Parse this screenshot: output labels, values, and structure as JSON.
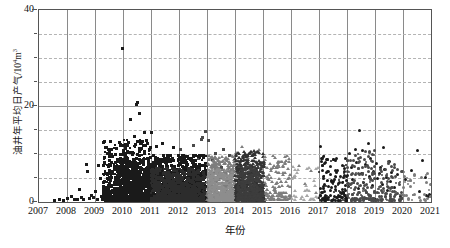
{
  "chart_data": {
    "type": "scatter",
    "title": "",
    "xlabel": "年份",
    "ylabel": "油井年平均日产气/10",
    "ylabel_sup": "4",
    "ylabel_tail": "m",
    "ylabel_tail_sup": "3",
    "xlim": [
      2007,
      2021
    ],
    "ylim": [
      0,
      40
    ],
    "ytick_labels": [
      "0",
      "20",
      "40"
    ],
    "ytick_values": [
      0,
      20,
      40
    ],
    "yminor_step": 5,
    "xtick_labels": [
      "2007",
      "2008",
      "2009",
      "2010",
      "2011",
      "2012",
      "2013",
      "2014",
      "2015",
      "2016",
      "2017",
      "2018",
      "2019",
      "2020",
      "2021"
    ],
    "xtick_values": [
      2007,
      2008,
      2009,
      2010,
      2011,
      2012,
      2013,
      2014,
      2015,
      2016,
      2017,
      2018,
      2019,
      2020,
      2021
    ],
    "grid": {
      "vertical": "solid",
      "horizontal": "dashed",
      "horizontal_major_at": [
        20
      ]
    },
    "legend": "none",
    "marker_colors": {
      "black": "#1a1a1a",
      "dark_gray": "#4a4a4a",
      "mid_gray": "#7d7d7d",
      "light_gray": "#a8a8a8"
    },
    "axis_color": "#555555",
    "series": [
      {
        "name": "2007-2011 早期井",
        "marker": "square",
        "color": "#1a1a1a",
        "points": [
          [
            2007.55,
            0.35
          ],
          [
            2007.72,
            0.5
          ],
          [
            2007.88,
            0.4
          ],
          [
            2008.02,
            0.8
          ],
          [
            2008.15,
            1.1
          ],
          [
            2008.25,
            0.45
          ],
          [
            2008.38,
            0.6
          ],
          [
            2008.45,
            2.6
          ],
          [
            2008.52,
            1.0
          ],
          [
            2008.6,
            0.55
          ],
          [
            2008.68,
            7.8
          ],
          [
            2008.72,
            6.4
          ],
          [
            2008.8,
            0.7
          ],
          [
            2008.88,
            1.4
          ],
          [
            2008.95,
            0.95
          ],
          [
            2009.02,
            2.2
          ],
          [
            2009.08,
            0.6
          ],
          [
            2009.12,
            7.6
          ],
          [
            2009.18,
            4.9
          ],
          [
            2009.22,
            1.2
          ],
          [
            2009.28,
            0.5
          ],
          [
            2009.32,
            3.1
          ],
          [
            2009.38,
            2.0
          ],
          [
            2009.42,
            6.0
          ],
          [
            2009.45,
            0.9
          ],
          [
            2009.5,
            1.6
          ],
          [
            2009.55,
            12.6
          ],
          [
            2009.58,
            5.2
          ],
          [
            2009.62,
            2.4
          ],
          [
            2009.65,
            1.0
          ],
          [
            2009.68,
            3.6
          ],
          [
            2009.72,
            7.0
          ],
          [
            2009.75,
            4.2
          ],
          [
            2009.78,
            1.8
          ],
          [
            2009.82,
            2.9
          ],
          [
            2009.85,
            0.7
          ],
          [
            2009.88,
            5.8
          ],
          [
            2009.9,
            11.8
          ],
          [
            2009.92,
            3.3
          ],
          [
            2009.95,
            1.5
          ],
          [
            2009.97,
            31.9
          ],
          [
            2010.0,
            2.1
          ],
          [
            2010.02,
            6.8
          ],
          [
            2010.05,
            4.4
          ],
          [
            2010.07,
            9.2
          ],
          [
            2010.1,
            1.3
          ],
          [
            2010.12,
            3.8
          ],
          [
            2010.15,
            12.0
          ],
          [
            2010.17,
            2.6
          ],
          [
            2010.2,
            5.5
          ],
          [
            2010.22,
            8.1
          ],
          [
            2010.25,
            17.3
          ],
          [
            2010.27,
            3.0
          ],
          [
            2010.3,
            6.2
          ],
          [
            2010.32,
            1.9
          ],
          [
            2010.35,
            10.4
          ],
          [
            2010.37,
            4.7
          ],
          [
            2010.4,
            13.6
          ],
          [
            2010.42,
            2.3
          ],
          [
            2010.45,
            7.4
          ],
          [
            2010.47,
            20.4
          ],
          [
            2010.5,
            20.8
          ],
          [
            2010.52,
            5.0
          ],
          [
            2010.55,
            3.4
          ],
          [
            2010.57,
            9.8
          ],
          [
            2010.6,
            18.4
          ],
          [
            2010.62,
            6.6
          ],
          [
            2010.65,
            2.7
          ],
          [
            2010.67,
            11.2
          ],
          [
            2010.7,
            4.0
          ],
          [
            2010.72,
            8.6
          ],
          [
            2010.75,
            14.4
          ],
          [
            2010.77,
            1.7
          ],
          [
            2010.8,
            5.6
          ],
          [
            2010.82,
            3.2
          ],
          [
            2010.85,
            12.8
          ],
          [
            2010.87,
            7.2
          ],
          [
            2010.9,
            2.5
          ],
          [
            2010.92,
            9.0
          ],
          [
            2010.95,
            4.6
          ],
          [
            2010.97,
            6.4
          ],
          [
            2011.0,
            14.5
          ],
          [
            2011.05,
            3.9
          ],
          [
            2011.1,
            8.2
          ],
          [
            2011.15,
            5.1
          ],
          [
            2011.2,
            11.6
          ],
          [
            2011.25,
            2.8
          ],
          [
            2011.3,
            7.0
          ],
          [
            2011.4,
            12.2
          ],
          [
            2011.5,
            4.3
          ],
          [
            2011.6,
            9.4
          ],
          [
            2011.7,
            6.1
          ],
          [
            2011.8,
            11.4
          ],
          [
            2011.9,
            3.6
          ]
        ]
      },
      {
        "name": "2011-2013 中期井",
        "marker": "square",
        "color": "#4a4a4a",
        "points": [
          [
            2012.05,
            10.9
          ],
          [
            2012.2,
            8.4
          ],
          [
            2012.35,
            6.0
          ],
          [
            2012.5,
            11.8
          ],
          [
            2012.6,
            4.2
          ],
          [
            2012.7,
            9.1
          ],
          [
            2012.8,
            13.0
          ],
          [
            2012.85,
            13.4
          ],
          [
            2012.9,
            5.5
          ],
          [
            2012.95,
            14.6
          ],
          [
            2013.0,
            7.8
          ],
          [
            2013.05,
            12.9
          ],
          [
            2013.1,
            3.1
          ],
          [
            2013.2,
            8.8
          ],
          [
            2013.3,
            10.2
          ],
          [
            2013.4,
            5.9
          ],
          [
            2013.5,
            7.1
          ],
          [
            2013.6,
            11.0
          ],
          [
            2013.7,
            4.4
          ],
          [
            2013.8,
            9.6
          ],
          [
            2013.9,
            6.3
          ]
        ]
      },
      {
        "name": "2013-2015 后期井",
        "marker": "triangle",
        "color": "#7d7d7d",
        "points": [
          [
            2014.05,
            10.0
          ],
          [
            2014.15,
            7.5
          ],
          [
            2014.25,
            11.3
          ],
          [
            2014.35,
            5.2
          ],
          [
            2014.45,
            8.9
          ],
          [
            2014.55,
            4.1
          ],
          [
            2014.65,
            9.7
          ],
          [
            2014.75,
            6.6
          ],
          [
            2014.85,
            10.6
          ],
          [
            2014.95,
            3.8
          ],
          [
            2015.05,
            8.0
          ],
          [
            2015.2,
            5.4
          ],
          [
            2015.35,
            9.3
          ],
          [
            2015.5,
            6.9
          ],
          [
            2015.65,
            4.0
          ],
          [
            2015.8,
            7.7
          ],
          [
            2015.95,
            2.9
          ],
          [
            2016.1,
            5.0
          ],
          [
            2016.3,
            7.4
          ],
          [
            2016.5,
            3.5
          ],
          [
            2016.7,
            6.2
          ],
          [
            2016.9,
            1.6
          ]
        ]
      },
      {
        "name": "2017-2021 新井",
        "marker": "circle",
        "color": "#1a1a1a",
        "points": [
          [
            2017.05,
            11.5
          ],
          [
            2017.08,
            9.0
          ],
          [
            2017.1,
            8.4
          ],
          [
            2017.12,
            7.6
          ],
          [
            2017.15,
            5.0
          ],
          [
            2017.18,
            3.6
          ],
          [
            2017.2,
            2.2
          ],
          [
            2017.25,
            6.2
          ],
          [
            2017.3,
            4.4
          ],
          [
            2017.35,
            1.0
          ],
          [
            2017.4,
            5.8
          ],
          [
            2017.45,
            3.0
          ],
          [
            2017.5,
            8.8
          ],
          [
            2017.55,
            4.8
          ],
          [
            2017.6,
            2.6
          ],
          [
            2017.65,
            6.6
          ],
          [
            2017.7,
            3.9
          ],
          [
            2017.75,
            5.3
          ],
          [
            2017.8,
            1.8
          ],
          [
            2017.85,
            4.1
          ],
          [
            2017.9,
            6.9
          ],
          [
            2017.95,
            2.4
          ],
          [
            2018.0,
            5.6
          ],
          [
            2018.05,
            3.3
          ],
          [
            2018.1,
            10.1
          ],
          [
            2018.15,
            7.2
          ],
          [
            2018.2,
            4.6
          ],
          [
            2018.3,
            11.0
          ],
          [
            2018.35,
            8.2
          ],
          [
            2018.4,
            2.9
          ],
          [
            2018.45,
            15.0
          ],
          [
            2018.5,
            6.0
          ],
          [
            2018.55,
            10.8
          ],
          [
            2018.6,
            4.0
          ],
          [
            2018.65,
            7.8
          ],
          [
            2018.7,
            2.0
          ],
          [
            2018.75,
            12.2
          ],
          [
            2018.8,
            5.4
          ],
          [
            2018.85,
            9.1
          ],
          [
            2018.9,
            3.4
          ],
          [
            2018.95,
            6.4
          ],
          [
            2019.0,
            0.6
          ],
          [
            2019.05,
            8.0
          ],
          [
            2019.1,
            4.9
          ],
          [
            2019.15,
            5.9
          ],
          [
            2019.2,
            7.1
          ],
          [
            2019.25,
            3.7
          ],
          [
            2019.3,
            11.3
          ],
          [
            2019.35,
            6.7
          ],
          [
            2019.4,
            5.1
          ],
          [
            2019.45,
            2.5
          ],
          [
            2019.5,
            8.5
          ],
          [
            2019.55,
            4.3
          ],
          [
            2019.6,
            6.1
          ],
          [
            2019.7,
            3.1
          ],
          [
            2019.8,
            5.7
          ],
          [
            2019.9,
            1.2
          ],
          [
            2020.1,
            4.7
          ],
          [
            2020.3,
            6.5
          ],
          [
            2020.5,
            10.7
          ],
          [
            2020.6,
            2.1
          ],
          [
            2020.7,
            8.7
          ],
          [
            2020.8,
            5.2
          ],
          [
            2020.85,
            1.4
          ],
          [
            2020.9,
            1.1
          ],
          [
            2020.95,
            1.5
          ],
          [
            2021.0,
            1.3
          ]
        ]
      }
    ]
  }
}
